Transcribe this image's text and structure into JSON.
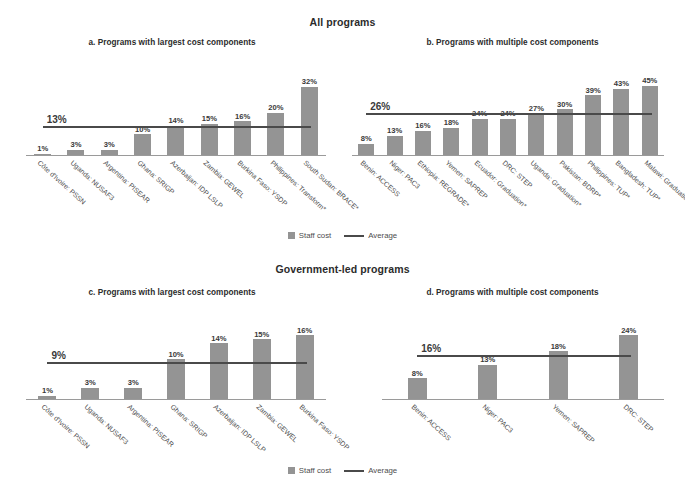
{
  "sections": [
    {
      "id": "all",
      "title": "All programs"
    },
    {
      "id": "gov",
      "title": "Government-led programs"
    }
  ],
  "legend": {
    "bar_label": "Staff cost",
    "line_label": "Average",
    "bar_color": "#949494",
    "line_color": "#4a4a4a"
  },
  "chart_data": [
    {
      "id": "a",
      "type": "bar",
      "title": "a. Programs with largest cost components",
      "xlabel": "",
      "ylabel": "",
      "ylim": [
        0,
        36
      ],
      "grid": false,
      "legend_position": "bottom-center",
      "series_name": "Staff cost",
      "value_suffix": "%",
      "categories": [
        "Côte d'Ivoire: PSSN",
        "Uganda: NUSAF3",
        "Argentina: PISEAR",
        "Ghana: SRIGP",
        "Azerbaijan: IDP LSLP",
        "Zambia: GEWEL",
        "Burkina Faso: YSDP",
        "Philippines: Transform*",
        "South Sudan: BRACE*"
      ],
      "values": [
        1,
        3,
        3,
        10,
        14,
        15,
        16,
        20,
        32
      ],
      "value_labels": [
        "1%",
        "3%",
        "3%",
        "10%",
        "14%",
        "15%",
        "16%",
        "20%",
        "32%"
      ],
      "average": 13,
      "average_label": "13%"
    },
    {
      "id": "b",
      "type": "bar",
      "title": "b. Programs with multiple cost components",
      "xlabel": "",
      "ylabel": "",
      "ylim": [
        0,
        50
      ],
      "grid": false,
      "legend_position": "bottom-center",
      "series_name": "Staff cost",
      "value_suffix": "%",
      "categories": [
        "Benin: ACCESS",
        "Niger: PAC3",
        "Ethiopia: REGRADE*",
        "Yemen: SAPREP",
        "Ecuador: Graduation*",
        "DRC: STEP",
        "Uganda: Graduation*",
        "Pakistan: BDRP*",
        "Philippines: TUP*",
        "Bangladesh: TUP*",
        "Malawi: Graduation*"
      ],
      "values": [
        8,
        13,
        16,
        18,
        24,
        24,
        27,
        30,
        39,
        43,
        45
      ],
      "value_labels": [
        "8%",
        "13%",
        "16%",
        "18%",
        "24%",
        "24%",
        "27%",
        "30%",
        "39%",
        "43%",
        "45%"
      ],
      "average": 26,
      "average_label": "26%"
    },
    {
      "id": "c",
      "type": "bar",
      "title": "c. Programs with largest cost components",
      "xlabel": "",
      "ylabel": "",
      "ylim": [
        0,
        18
      ],
      "grid": false,
      "legend_position": "bottom-center",
      "series_name": "Staff cost",
      "value_suffix": "%",
      "categories": [
        "Côte d'Ivoire: PSSN",
        "Uganda: NUSAF3",
        "Argentina: PISEAR",
        "Ghana: SRIGP",
        "Azerbaijan: IDP LSLP",
        "Zambia: GEWEL",
        "Burkina Faso: YSDP"
      ],
      "values": [
        1,
        3,
        3,
        10,
        14,
        15,
        16
      ],
      "value_labels": [
        "1%",
        "3%",
        "3%",
        "10%",
        "14%",
        "15%",
        "16%"
      ],
      "average": 9,
      "average_label": "9%"
    },
    {
      "id": "d",
      "type": "bar",
      "title": "d. Programs with multiple cost components",
      "xlabel": "",
      "ylabel": "",
      "ylim": [
        0,
        27
      ],
      "grid": false,
      "legend_position": "bottom-center",
      "series_name": "Staff cost",
      "value_suffix": "%",
      "categories": [
        "Benin: ACCESS",
        "Niger: PAC3",
        "Yemen: SAPREP",
        "DRC: STEP"
      ],
      "values": [
        8,
        13,
        18,
        24
      ],
      "value_labels": [
        "8%",
        "13%",
        "18%",
        "24%"
      ],
      "average": 16,
      "average_label": "16%"
    }
  ]
}
